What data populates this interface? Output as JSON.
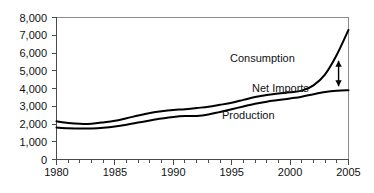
{
  "chart_data": {
    "type": "line",
    "title": "",
    "xlabel": "",
    "ylabel": "",
    "xlim": [
      1980,
      2005
    ],
    "ylim": [
      0,
      8000
    ],
    "grid": false,
    "legend_position": "inline-annotations",
    "x": [
      1980,
      1981,
      1982,
      1983,
      1984,
      1985,
      1986,
      1987,
      1988,
      1989,
      1990,
      1991,
      1992,
      1993,
      1994,
      1995,
      1996,
      1997,
      1998,
      1999,
      2000,
      2001,
      2002,
      2003,
      2004,
      2005
    ],
    "xticklabels": [
      "1980",
      "1985",
      "1990",
      "1995",
      "2000",
      "2005"
    ],
    "xtick_values": [
      1980,
      1985,
      1990,
      1995,
      2000,
      2005
    ],
    "yticklabels": [
      "0",
      "1,000",
      "2,000",
      "3,000",
      "4,000",
      "5,000",
      "6,000",
      "7,000",
      "8,000"
    ],
    "ytick_values": [
      0,
      1000,
      2000,
      3000,
      4000,
      5000,
      6000,
      7000,
      8000
    ],
    "series": [
      {
        "name": "Consumption",
        "values": [
          2150,
          2060,
          2010,
          2020,
          2090,
          2180,
          2320,
          2480,
          2620,
          2720,
          2790,
          2830,
          2900,
          2970,
          3080,
          3200,
          3360,
          3520,
          3640,
          3720,
          3790,
          3880,
          4180,
          4800,
          5900,
          7300
        ]
      },
      {
        "name": "Production",
        "values": [
          1800,
          1760,
          1740,
          1750,
          1790,
          1860,
          1960,
          2080,
          2200,
          2310,
          2400,
          2450,
          2450,
          2530,
          2680,
          2830,
          2990,
          3140,
          3260,
          3350,
          3440,
          3540,
          3680,
          3800,
          3870,
          3900
        ]
      }
    ],
    "annotations": [
      {
        "name": "Consumption",
        "label": "Consumption"
      },
      {
        "name": "Net Imports",
        "label": "Net Imports"
      },
      {
        "name": "Production",
        "label": "Production"
      }
    ],
    "net_imports_2005": 3400
  }
}
